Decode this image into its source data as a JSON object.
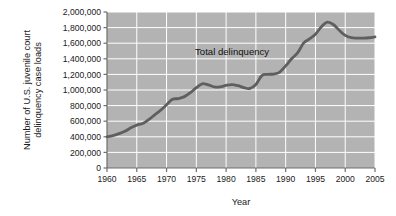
{
  "chart_data": {
    "type": "line",
    "title": "",
    "xlabel": "Year",
    "ylabel": "Number of U.S. juvenile court delinquency case loads",
    "ylabel_line1": "Number of U.S. juvenile court",
    "ylabel_line2": "delinquency case loads",
    "xlim": [
      1960,
      2005
    ],
    "ylim": [
      0,
      2000000
    ],
    "grid": true,
    "legend_position": "none",
    "annotations": [
      {
        "text": "Total delinquency",
        "x": 1981,
        "y": 1450000
      }
    ],
    "xticks": [
      1960,
      1965,
      1970,
      1975,
      1980,
      1985,
      1990,
      1995,
      2000,
      2005
    ],
    "xtick_labels": [
      "1960",
      "1965",
      "1970",
      "1975",
      "1980",
      "1985",
      "1990",
      "1995",
      "2000",
      "2005"
    ],
    "yticks": [
      0,
      200000,
      400000,
      600000,
      800000,
      1000000,
      1200000,
      1400000,
      1600000,
      1800000,
      2000000
    ],
    "ytick_labels": [
      "0",
      "200,000",
      "400,000",
      "600,000",
      "800,000",
      "1,000,000",
      "1,200,000",
      "1,400,000",
      "1,600,000",
      "1,800,000",
      "2,000,000"
    ],
    "series": [
      {
        "name": "Total delinquency",
        "color": "#5f5f5f",
        "x": [
          1960,
          1961,
          1962,
          1963,
          1964,
          1965,
          1966,
          1967,
          1968,
          1969,
          1970,
          1971,
          1972,
          1973,
          1974,
          1975,
          1976,
          1977,
          1978,
          1979,
          1980,
          1981,
          1982,
          1983,
          1984,
          1985,
          1986,
          1987,
          1988,
          1989,
          1990,
          1991,
          1992,
          1993,
          1994,
          1995,
          1996,
          1997,
          1998,
          1999,
          2000,
          2001,
          2002,
          2003,
          2004,
          2005
        ],
        "values": [
          400000,
          415000,
          440000,
          470000,
          515000,
          550000,
          570000,
          620000,
          680000,
          740000,
          810000,
          880000,
          890000,
          915000,
          965000,
          1030000,
          1080000,
          1065000,
          1040000,
          1040000,
          1060000,
          1070000,
          1055000,
          1030000,
          1020000,
          1070000,
          1185000,
          1200000,
          1205000,
          1230000,
          1310000,
          1400000,
          1475000,
          1600000,
          1655000,
          1715000,
          1810000,
          1870000,
          1840000,
          1765000,
          1700000,
          1670000,
          1665000,
          1665000,
          1670000,
          1680000
        ]
      }
    ],
    "colors": {
      "plot_background": "#b3b3b3",
      "gridline": "#ffffff",
      "axis": "#6e6e6e",
      "line": "#5f5f5f",
      "text": "#1a1a1a",
      "page_background": "#ffffff"
    }
  }
}
